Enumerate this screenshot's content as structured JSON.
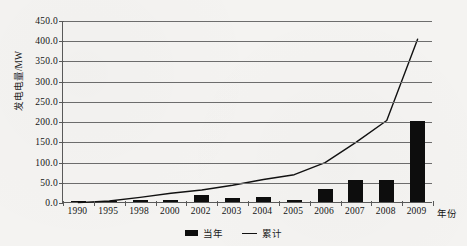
{
  "chart_data": {
    "type": "bar",
    "title": "",
    "xlabel": "年份",
    "ylabel": "发电电量/MW",
    "categories": [
      "1990",
      "1995",
      "1998",
      "2000",
      "2002",
      "2003",
      "2004",
      "2005",
      "2006",
      "2007",
      "2008",
      "2009"
    ],
    "ylim": [
      0,
      450
    ],
    "yticks": [
      "0.0",
      "50.0",
      "100.0",
      "150.0",
      "200.0",
      "250.0",
      "300.0",
      "350.0",
      "400.0",
      "450.0"
    ],
    "ytick_values": [
      0,
      50,
      100,
      150,
      200,
      250,
      300,
      350,
      400,
      450
    ],
    "grid": "horizontal",
    "legend_position": "bottom-center",
    "series": [
      {
        "name": "当年",
        "type": "bar",
        "values": [
          0.3,
          1.5,
          4.0,
          5.0,
          17.0,
          10.0,
          13.0,
          4.0,
          32.0,
          54.0,
          54.0,
          200.0
        ]
      },
      {
        "name": "累计",
        "type": "line",
        "values": [
          1.0,
          5.0,
          14.0,
          24.0,
          32.0,
          44.0,
          58.0,
          70.0,
          100.0,
          150.0,
          204.0,
          405.0
        ]
      }
    ]
  },
  "legend": {
    "items": [
      {
        "label": "当年",
        "marker": "bar-swatch",
        "color": "#0d0d0d"
      },
      {
        "label": "累计",
        "marker": "line-swatch",
        "color": "#111111"
      }
    ]
  },
  "colors": {
    "bar": "#0d0d0d",
    "line": "#111111",
    "grid": "#6d6d6d",
    "axis": "#5a5a5a",
    "background": "#f4f3f1",
    "text": "#131313"
  }
}
